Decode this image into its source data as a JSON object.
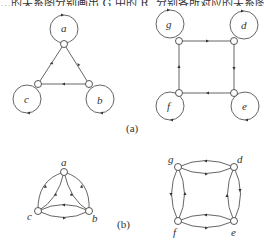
{
  "header": {
    "text": "…的关系图分别画出 G 中的 R, 分别各所对应的关系图"
  },
  "figure_a": {
    "caption": "(a)",
    "graph1": {
      "nodes": [
        {
          "id": "a",
          "label": "a"
        },
        {
          "id": "b",
          "label": "b"
        },
        {
          "id": "c",
          "label": "c"
        }
      ],
      "edges": [
        [
          "a",
          "a"
        ],
        [
          "b",
          "b"
        ],
        [
          "c",
          "c"
        ],
        [
          "c",
          "a"
        ],
        [
          "a",
          "b"
        ],
        [
          "b",
          "c"
        ]
      ]
    },
    "graph2": {
      "nodes": [
        {
          "id": "g",
          "label": "g"
        },
        {
          "id": "d",
          "label": "d"
        },
        {
          "id": "e",
          "label": "e"
        },
        {
          "id": "f",
          "label": "f"
        }
      ],
      "edges": [
        [
          "g",
          "g"
        ],
        [
          "d",
          "d"
        ],
        [
          "e",
          "e"
        ],
        [
          "f",
          "f"
        ],
        [
          "g",
          "d"
        ],
        [
          "d",
          "e"
        ],
        [
          "e",
          "f"
        ],
        [
          "f",
          "g"
        ]
      ]
    }
  },
  "figure_b": {
    "caption": "(b)",
    "graph1": {
      "nodes": [
        {
          "id": "a",
          "label": "a"
        },
        {
          "id": "b",
          "label": "b"
        },
        {
          "id": "c",
          "label": "c"
        }
      ],
      "edges": [
        [
          "a",
          "c"
        ],
        [
          "c",
          "a"
        ],
        [
          "a",
          "b"
        ],
        [
          "b",
          "a"
        ],
        [
          "b",
          "c"
        ],
        [
          "c",
          "b"
        ]
      ]
    },
    "graph2": {
      "nodes": [
        {
          "id": "g",
          "label": "g"
        },
        {
          "id": "d",
          "label": "d"
        },
        {
          "id": "e",
          "label": "e"
        },
        {
          "id": "f",
          "label": "f"
        }
      ],
      "edges": [
        [
          "g",
          "d"
        ],
        [
          "d",
          "g"
        ],
        [
          "d",
          "e"
        ],
        [
          "e",
          "d"
        ],
        [
          "e",
          "f"
        ],
        [
          "f",
          "e"
        ],
        [
          "f",
          "g"
        ],
        [
          "g",
          "f"
        ]
      ]
    }
  }
}
